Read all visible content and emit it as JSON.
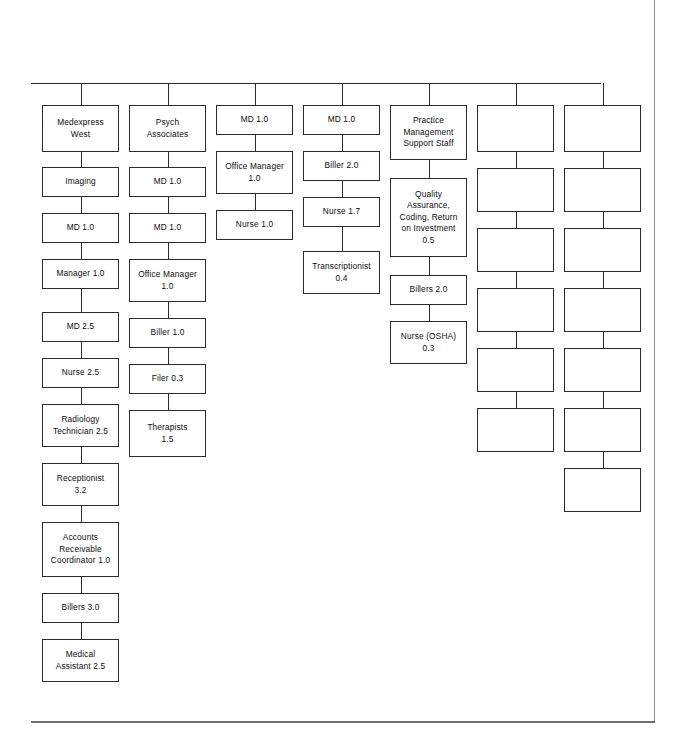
{
  "document": {
    "kind": "organizational-chart",
    "background_color": "#ffffff",
    "line_color": "#2b2b2b",
    "page_rule_color": "#6d7175"
  },
  "chart": {
    "trunk": {
      "x": 31,
      "y": 83,
      "width": 570,
      "drop_height": 22
    },
    "columns": [
      {
        "id": "column-1",
        "name": "medexpress-west",
        "x": 42,
        "width": 77,
        "nodes": [
          {
            "label": "Medexpress\nWest",
            "y": 105,
            "height": 47
          },
          {
            "label": "Imaging",
            "y": 167,
            "height": 30
          },
          {
            "label": "MD 1.0",
            "y": 213,
            "height": 30
          },
          {
            "label": "Manager 1.0",
            "y": 259,
            "height": 30
          },
          {
            "label": "MD 2.5",
            "y": 312,
            "height": 30
          },
          {
            "label": "Nurse 2.5",
            "y": 358,
            "height": 30
          },
          {
            "label": "Radiology\nTechnician 2.5",
            "y": 404,
            "height": 43
          },
          {
            "label": "Receptionist\n3.2",
            "y": 463,
            "height": 43
          },
          {
            "label": "Accounts\nReceivable\nCoordinator 1.0",
            "y": 522,
            "height": 55
          },
          {
            "label": "Billers 3.0",
            "y": 593,
            "height": 30
          },
          {
            "label": "Medical\nAssistant 2.5",
            "y": 639,
            "height": 43
          }
        ]
      },
      {
        "id": "column-2",
        "name": "psych-associates",
        "x": 129,
        "width": 77,
        "nodes": [
          {
            "label": "Psych\nAssociates",
            "y": 105,
            "height": 47
          },
          {
            "label": "MD 1.0",
            "y": 167,
            "height": 30
          },
          {
            "label": "MD 1.0",
            "y": 213,
            "height": 30
          },
          {
            "label": "Office Manager\n1.0",
            "y": 259,
            "height": 43
          },
          {
            "label": "Biller 1.0",
            "y": 318,
            "height": 30
          },
          {
            "label": "Filer 0.3",
            "y": 364,
            "height": 30
          },
          {
            "label": "Therapists\n1.5",
            "y": 410,
            "height": 47
          }
        ]
      },
      {
        "id": "column-3",
        "name": "md-office-nurse",
        "x": 216,
        "width": 77,
        "nodes": [
          {
            "label": "MD 1.0",
            "y": 105,
            "height": 30
          },
          {
            "label": "Office Manager\n1.0",
            "y": 151,
            "height": 43
          },
          {
            "label": "Nurse 1.0",
            "y": 210,
            "height": 30
          }
        ]
      },
      {
        "id": "column-4",
        "name": "md-biller-nurse-transcriptionist",
        "x": 303,
        "width": 77,
        "nodes": [
          {
            "label": "MD 1.0",
            "y": 105,
            "height": 30
          },
          {
            "label": "Biller 2.0",
            "y": 151,
            "height": 30
          },
          {
            "label": "Nurse 1.7",
            "y": 197,
            "height": 30
          },
          {
            "label": "Transcriptionist\n0.4",
            "y": 251,
            "height": 43
          }
        ]
      },
      {
        "id": "column-5",
        "name": "practice-management-support-staff",
        "x": 390,
        "width": 77,
        "nodes": [
          {
            "label": "Practice\nManagement\nSupport Staff",
            "y": 105,
            "height": 55
          },
          {
            "label": "Quality\nAssurance,\nCoding, Return\non Investment\n0.5",
            "y": 178,
            "height": 79
          },
          {
            "label": "Billers 2.0",
            "y": 275,
            "height": 30
          },
          {
            "label": "Nurse (OSHA)\n0.3",
            "y": 321,
            "height": 43
          }
        ]
      },
      {
        "id": "column-6",
        "name": "unlabeled-column-6",
        "x": 477,
        "width": 77,
        "nodes": [
          {
            "label": "",
            "y": 105,
            "height": 47
          },
          {
            "label": "",
            "y": 168,
            "height": 44
          },
          {
            "label": "",
            "y": 228,
            "height": 44
          },
          {
            "label": "",
            "y": 288,
            "height": 44
          },
          {
            "label": "",
            "y": 348,
            "height": 44
          },
          {
            "label": "",
            "y": 408,
            "height": 44
          }
        ]
      },
      {
        "id": "column-7",
        "name": "unlabeled-column-7",
        "x": 564,
        "width": 77,
        "nodes": [
          {
            "label": "",
            "y": 105,
            "height": 47
          },
          {
            "label": "",
            "y": 168,
            "height": 44
          },
          {
            "label": "",
            "y": 228,
            "height": 44
          },
          {
            "label": "",
            "y": 288,
            "height": 44
          },
          {
            "label": "",
            "y": 348,
            "height": 44
          },
          {
            "label": "",
            "y": 408,
            "height": 44
          },
          {
            "label": "",
            "y": 468,
            "height": 44
          }
        ]
      }
    ]
  }
}
